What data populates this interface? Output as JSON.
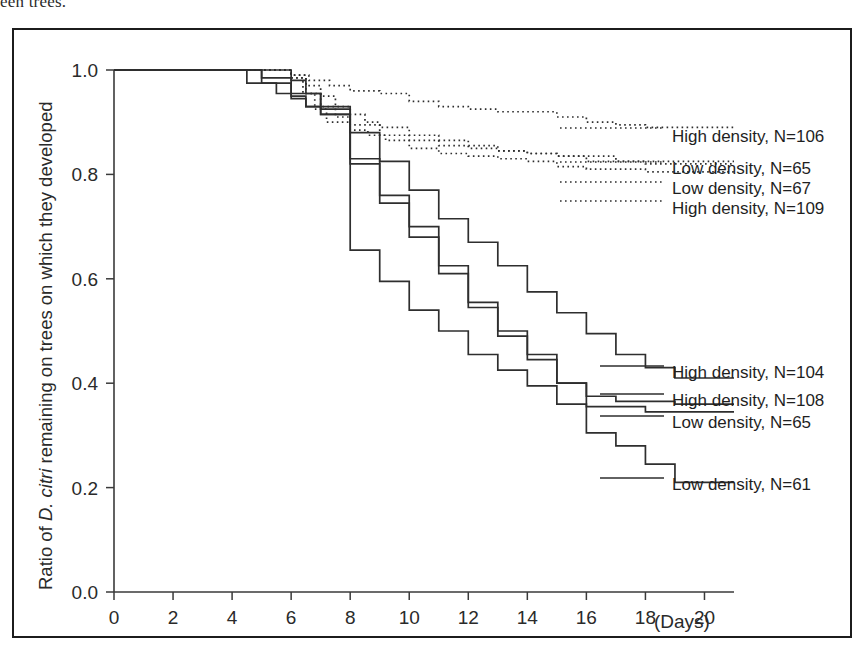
{
  "page": {
    "cut_off_caption_text": "een trees."
  },
  "chart_data": {
    "type": "line",
    "subtype": "kaplan-meier step survival curves",
    "title": "",
    "xlabel": "(Days)",
    "ylabel": "Ratio of D. citri remaining on trees on which they developed",
    "ylabel_italic_part": "D. citri",
    "ylabel_prefix": "Ratio of ",
    "ylabel_suffix": " remaining on trees on which they developed",
    "xlim": [
      0,
      21
    ],
    "ylim": [
      0.0,
      1.0
    ],
    "xticks": [
      0,
      2,
      4,
      6,
      8,
      10,
      12,
      14,
      16,
      18,
      20
    ],
    "xtick_labels": [
      "0",
      "2",
      "4",
      "6",
      "8",
      "10",
      "12",
      "14",
      "16",
      "18",
      "20"
    ],
    "yticks": [
      0.0,
      0.2,
      0.4,
      0.6,
      0.8,
      1.0
    ],
    "ytick_labels": [
      "0.0",
      "0.2",
      "0.4",
      "0.6",
      "0.8",
      "1.0"
    ],
    "grid": false,
    "legend_position": "inline-right-of-curves",
    "series": [
      {
        "name": "High density, N=106",
        "style": "dotted",
        "label_x_px": 672,
        "label_y_px": 140,
        "leader_from_x": 560,
        "leader_y": 132,
        "x": [
          0,
          5,
          6,
          6.6,
          7.3,
          8,
          9,
          10,
          11,
          12,
          13,
          15,
          16,
          17,
          18,
          21
        ],
        "y": [
          1.0,
          1.0,
          0.99,
          0.98,
          0.97,
          0.96,
          0.955,
          0.94,
          0.93,
          0.925,
          0.92,
          0.91,
          0.9,
          0.895,
          0.89,
          0.89
        ]
      },
      {
        "name": "Low density, N=65",
        "style": "dotted",
        "label_x_px": 672,
        "label_y_px": 172,
        "leader_from_x": 560,
        "leader_y": 166,
        "x": [
          0,
          5,
          6,
          6.5,
          7,
          7.5,
          8,
          9,
          10,
          11,
          12,
          13,
          14,
          15,
          16,
          18,
          21
        ],
        "y": [
          1.0,
          1.0,
          0.985,
          0.955,
          0.93,
          0.91,
          0.895,
          0.875,
          0.865,
          0.855,
          0.85,
          0.845,
          0.84,
          0.835,
          0.825,
          0.82,
          0.82
        ]
      },
      {
        "name": "Low density, N=67",
        "style": "dotted",
        "label_x_px": 672,
        "label_y_px": 192,
        "leader_from_x": 560,
        "leader_y": 186,
        "x": [
          0,
          5.5,
          6,
          6.5,
          7,
          7.5,
          8,
          8.5,
          9,
          10,
          11,
          12,
          13,
          14,
          15,
          17,
          21
        ],
        "y": [
          1.0,
          1.0,
          0.99,
          0.97,
          0.95,
          0.93,
          0.915,
          0.9,
          0.89,
          0.875,
          0.865,
          0.855,
          0.845,
          0.84,
          0.835,
          0.825,
          0.825
        ]
      },
      {
        "name": "High density, N=109",
        "style": "dotted",
        "label_x_px": 672,
        "label_y_px": 212,
        "leader_from_x": 560,
        "leader_y": 205,
        "x": [
          0,
          5.4,
          6,
          6.4,
          6.8,
          7.2,
          8,
          8.6,
          9.2,
          10,
          11,
          12,
          13,
          14,
          15,
          16,
          18,
          21
        ],
        "y": [
          1.0,
          1.0,
          0.985,
          0.955,
          0.925,
          0.9,
          0.885,
          0.875,
          0.865,
          0.85,
          0.84,
          0.835,
          0.83,
          0.825,
          0.815,
          0.81,
          0.805,
          0.805
        ]
      },
      {
        "name": "High density, N=104",
        "style": "solid",
        "label_x_px": 672,
        "label_y_px": 376,
        "leader_from_x": 600,
        "leader_y": 370,
        "x": [
          0,
          3,
          5,
          6,
          7,
          8,
          9,
          10,
          11,
          12,
          13,
          14,
          15,
          16,
          17,
          18,
          19,
          21
        ],
        "y": [
          1.0,
          1.0,
          0.985,
          0.955,
          0.925,
          0.88,
          0.825,
          0.77,
          0.715,
          0.67,
          0.625,
          0.575,
          0.535,
          0.495,
          0.455,
          0.43,
          0.41,
          0.41
        ]
      },
      {
        "name": "High density, N=108",
        "style": "solid",
        "label_x_px": 672,
        "label_y_px": 404,
        "leader_from_x": 600,
        "leader_y": 398,
        "x": [
          0,
          4,
          5,
          6,
          6.5,
          7,
          8,
          9,
          10,
          11,
          12,
          13,
          14,
          15,
          16,
          17,
          19,
          21
        ],
        "y": [
          1.0,
          1.0,
          0.975,
          0.95,
          0.93,
          0.915,
          0.82,
          0.76,
          0.7,
          0.625,
          0.555,
          0.5,
          0.455,
          0.4,
          0.375,
          0.365,
          0.36,
          0.36
        ]
      },
      {
        "name": "Low density, N=65",
        "style": "solid",
        "label_x_px": 672,
        "label_y_px": 426,
        "leader_from_x": 600,
        "leader_y": 420,
        "x": [
          0,
          3,
          4.5,
          5.5,
          6,
          6.5,
          7,
          8,
          9,
          10,
          11,
          12,
          13,
          14,
          15,
          16,
          18,
          21
        ],
        "y": [
          1.0,
          1.0,
          0.975,
          0.955,
          0.945,
          0.93,
          0.915,
          0.83,
          0.745,
          0.68,
          0.61,
          0.545,
          0.49,
          0.445,
          0.4,
          0.355,
          0.345,
          0.345
        ]
      },
      {
        "name": "Low density, N=61",
        "style": "solid",
        "label_x_px": 672,
        "label_y_px": 488,
        "leader_from_x": 600,
        "leader_y": 482,
        "x": [
          0,
          5,
          6,
          6.5,
          7,
          8,
          9,
          10,
          11,
          12,
          13,
          14,
          15,
          16,
          17,
          18,
          19,
          21
        ],
        "y": [
          1.0,
          1.0,
          0.98,
          0.955,
          0.93,
          0.655,
          0.595,
          0.54,
          0.5,
          0.455,
          0.425,
          0.395,
          0.36,
          0.305,
          0.28,
          0.245,
          0.21,
          0.21
        ]
      }
    ]
  },
  "colors": {
    "line": "#2e2e2e",
    "axis": "#3a3a3a",
    "frame": "#1c1c1c",
    "text": "#231f20",
    "background": "#ffffff"
  }
}
